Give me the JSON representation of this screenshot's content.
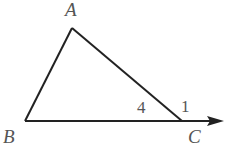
{
  "diagram": {
    "type": "triangle-with-exterior-angle",
    "vertices": {
      "A": {
        "label": "A",
        "x": 72,
        "y": 28
      },
      "B": {
        "label": "B",
        "x": 25,
        "y": 121
      },
      "C": {
        "label": "C",
        "x": 182,
        "y": 121
      }
    },
    "ray_end": {
      "x": 224,
      "y": 121
    },
    "angle_labels": {
      "interior_C": "4",
      "exterior_C": "1"
    },
    "stroke_color": "#222222",
    "label_color": "#555555"
  }
}
